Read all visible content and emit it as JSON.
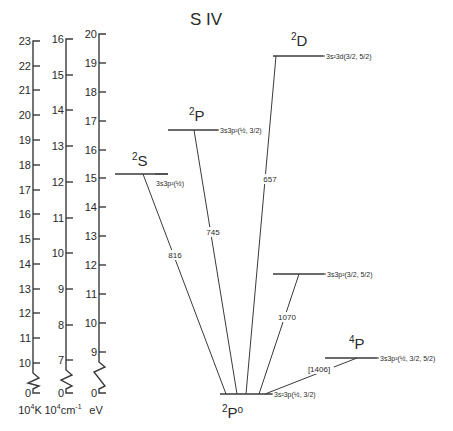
{
  "title": "S IV",
  "axes": [
    {
      "id": "kelvin",
      "unit_base": "10",
      "unit_exp": "4",
      "unit_rest": "K",
      "x": 33,
      "ticks": [
        {
          "label": "23",
          "y": 41
        },
        {
          "label": "22",
          "y": 66
        },
        {
          "label": "21",
          "y": 90
        },
        {
          "label": "20",
          "y": 115
        },
        {
          "label": "19",
          "y": 140
        },
        {
          "label": "18",
          "y": 165
        },
        {
          "label": "17",
          "y": 190
        },
        {
          "label": "16",
          "y": 214
        },
        {
          "label": "15",
          "y": 239
        },
        {
          "label": "14",
          "y": 264
        },
        {
          "label": "13",
          "y": 289
        },
        {
          "label": "12",
          "y": 313
        },
        {
          "label": "11",
          "y": 338
        },
        {
          "label": "10",
          "y": 363
        }
      ],
      "zero": {
        "label": "0",
        "y": 393
      }
    },
    {
      "id": "wavenumber",
      "unit_base": "10",
      "unit_exp": "4",
      "unit_rest": "cm",
      "unit_rest_exp": "-1",
      "x": 66,
      "ticks": [
        {
          "label": "16",
          "y": 39
        },
        {
          "label": "15",
          "y": 75
        },
        {
          "label": "14",
          "y": 110
        },
        {
          "label": "13",
          "y": 146
        },
        {
          "label": "12",
          "y": 182
        },
        {
          "label": "11",
          "y": 218
        },
        {
          "label": "10",
          "y": 253
        },
        {
          "label": "9",
          "y": 289
        },
        {
          "label": "8",
          "y": 325
        },
        {
          "label": "7",
          "y": 360
        }
      ],
      "zero": {
        "label": "0",
        "y": 393
      }
    },
    {
      "id": "electronvolt",
      "unit_base": "eV",
      "x": 99,
      "ticks": [
        {
          "label": "20",
          "y": 34
        },
        {
          "label": "19",
          "y": 63
        },
        {
          "label": "18",
          "y": 92
        },
        {
          "label": "17",
          "y": 121
        },
        {
          "label": "16",
          "y": 150
        },
        {
          "label": "15",
          "y": 178
        },
        {
          "label": "14",
          "y": 207
        },
        {
          "label": "13",
          "y": 236
        },
        {
          "label": "12",
          "y": 265
        },
        {
          "label": "11",
          "y": 294
        },
        {
          "label": "10",
          "y": 323
        },
        {
          "label": "9",
          "y": 352
        }
      ],
      "zero": {
        "label": "0",
        "y": 393
      }
    }
  ],
  "levels": [
    {
      "id": "ground",
      "term": "2P°",
      "term_mult": "2",
      "term_letter": "P",
      "term_parity": "o",
      "config": "3s²3p",
      "j": "(½, 3/2)",
      "energy_ev": 0.0,
      "x1": 220,
      "x2": 272,
      "y": 394,
      "term_x": 222,
      "term_y": 418,
      "cfg_x": 274,
      "cfg_y": 397
    },
    {
      "id": "4P",
      "term": "4P",
      "term_mult": "4",
      "term_letter": "P",
      "config": "3s3p²",
      "j": "(½, 3/2, 5/2)",
      "energy_ev": 8.8,
      "x1": 325,
      "x2": 377,
      "y": 358,
      "term_x": 349,
      "term_y": 349,
      "cfg_x": 380,
      "cfg_y": 361
    },
    {
      "id": "2D-low",
      "term": "",
      "config": "3s3p²",
      "j": "(3/2, 5/2)",
      "energy_ev": 11.7,
      "x1": 273,
      "x2": 324,
      "y": 274,
      "cfg_x": 327,
      "cfg_y": 277
    },
    {
      "id": "2S",
      "term": "2S",
      "term_mult": "2",
      "term_letter": "S",
      "config": "3s3p²",
      "j": "(½)",
      "energy_ev": 15.2,
      "x1": 115,
      "x2": 168,
      "y": 174,
      "term_x": 132,
      "term_y": 166,
      "cfg_x": 156,
      "cfg_y": 186
    },
    {
      "id": "2P",
      "term": "2P",
      "term_mult": "2",
      "term_letter": "P",
      "config": "3s3p²",
      "j": "(½, 3/2)",
      "energy_ev": 16.7,
      "x1": 168,
      "x2": 218,
      "y": 130,
      "term_x": 189,
      "term_y": 121,
      "cfg_x": 220,
      "cfg_y": 133
    },
    {
      "id": "2D",
      "term": "2D",
      "term_mult": "2",
      "term_letter": "D",
      "config": "3s²3d",
      "j": "(3/2, 5/2)",
      "energy_ev": 19.2,
      "x1": 273,
      "x2": 323,
      "y": 56,
      "term_x": 291,
      "term_y": 46,
      "cfg_x": 326,
      "cfg_y": 59
    }
  ],
  "transitions": [
    {
      "upper": "2S",
      "wavelength": "816",
      "x1": 143,
      "y1": 174,
      "x2": 226,
      "y2": 394,
      "label_x": 175,
      "label_y": 258
    },
    {
      "upper": "2P",
      "wavelength": "745",
      "x1": 194,
      "y1": 130,
      "x2": 237,
      "y2": 394,
      "label_x": 213,
      "label_y": 235
    },
    {
      "upper": "2D",
      "wavelength": "657",
      "x1": 276,
      "y1": 56,
      "x2": 246,
      "y2": 394,
      "label_x": 270,
      "label_y": 182
    },
    {
      "upper": "2D-low",
      "wavelength": "1070",
      "x1": 299,
      "y1": 274,
      "x2": 259,
      "y2": 394,
      "label_x": 287,
      "label_y": 320
    },
    {
      "upper": "4P",
      "wavelength": "[1406]",
      "x1": 357,
      "y1": 358,
      "x2": 265,
      "y2": 394,
      "label_x": 319,
      "label_y": 372
    }
  ]
}
